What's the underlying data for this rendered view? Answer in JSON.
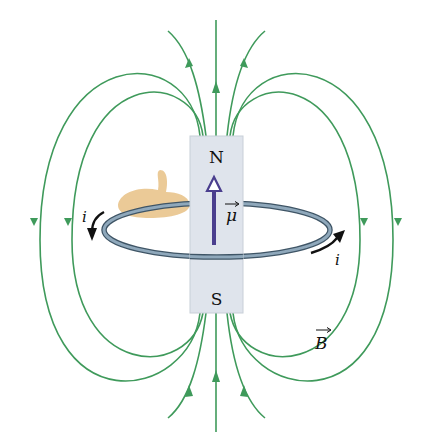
{
  "diagram": {
    "magnet": {
      "north_label": "N",
      "south_label": "S",
      "fill": "#dfe4ec"
    },
    "dipole_moment_label": "μ",
    "current_label_left": "i",
    "current_label_right": "i",
    "field_label": "B",
    "colors": {
      "field_lines": "#3f9a5b",
      "loop": "#6f8aa0",
      "dipole_arrow": "#4a3e8e",
      "hand": "#e9c48c",
      "current_arrow": "#111111"
    },
    "field_line_count": 11
  }
}
